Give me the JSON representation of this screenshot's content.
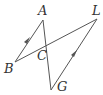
{
  "diagram": {
    "type": "geometry",
    "points": {
      "A": {
        "label": "A",
        "x": 43,
        "y": 20
      },
      "L": {
        "label": "L",
        "x": 97,
        "y": 19
      },
      "B": {
        "label": "B",
        "x": 15,
        "y": 62
      },
      "G": {
        "label": "G",
        "x": 51,
        "y": 90
      },
      "C": {
        "label": "C",
        "x": 45,
        "y": 48
      }
    },
    "segments": [
      {
        "from": "A",
        "to": "B",
        "parallel_mark": true
      },
      {
        "from": "A",
        "to": "G",
        "parallel_mark": false
      },
      {
        "from": "B",
        "to": "L",
        "parallel_mark": false
      },
      {
        "from": "L",
        "to": "G",
        "parallel_mark": true
      }
    ],
    "colors": {
      "stroke": "#555555",
      "label": "#333333"
    }
  }
}
